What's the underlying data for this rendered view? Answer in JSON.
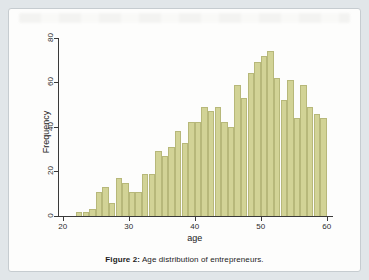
{
  "figure": {
    "caption_prefix": "Figure 2:",
    "caption_text": " Age distribution of entrepreneurs."
  },
  "chart_data": {
    "type": "bar",
    "subtype": "histogram",
    "title": "",
    "xlabel": "age",
    "ylabel": "Frequency",
    "bin_width": 1,
    "bin_start_ages": [
      22,
      23,
      24,
      25,
      26,
      27,
      28,
      29,
      30,
      31,
      32,
      33,
      34,
      35,
      36,
      37,
      38,
      39,
      40,
      41,
      42,
      43,
      44,
      45,
      46,
      47,
      48,
      49,
      50,
      51,
      52,
      53,
      54,
      55,
      56,
      57,
      58,
      59
    ],
    "values": [
      2,
      2,
      3,
      11,
      13,
      6,
      17,
      15,
      11,
      11,
      19,
      19,
      29,
      27,
      31,
      38,
      33,
      42,
      42,
      49,
      47,
      49,
      42,
      40,
      59,
      53,
      64,
      69,
      72,
      74,
      62,
      52,
      61,
      44,
      59,
      49,
      46,
      44
    ],
    "x_ticks": [
      20,
      30,
      40,
      50,
      60
    ],
    "y_ticks": [
      0,
      20,
      40,
      60,
      80
    ],
    "xlim": [
      20,
      60
    ],
    "ylim": [
      0,
      80
    ],
    "grid": false,
    "legend": "none",
    "bar_fill": "#d2d396",
    "bar_edge": "#b7b87a"
  }
}
